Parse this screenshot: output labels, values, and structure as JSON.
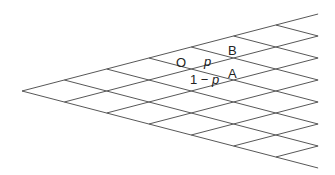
{
  "diagram": {
    "type": "binomial-lattice",
    "apex": {
      "x": 22,
      "y": 91
    },
    "step": {
      "dx": 42.3,
      "dy": 11
    },
    "columns": 7,
    "line_color": "#444444",
    "labels": {
      "origin": "O",
      "up_node": "B",
      "down_node": "A",
      "up_prob": "p",
      "down_prob_prefix": "1 − ",
      "down_prob_var": "p"
    }
  }
}
